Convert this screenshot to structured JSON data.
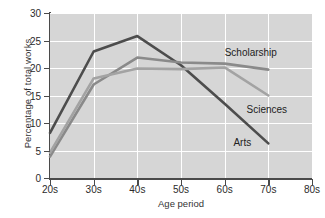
{
  "chart_data": {
    "type": "line",
    "title": "",
    "xlabel": "Age period",
    "ylabel": "Percentage of total works",
    "categories": [
      "20s",
      "30s",
      "40s",
      "50s",
      "60s",
      "70s",
      "80s"
    ],
    "x_tick_labels": [
      "20s",
      "30s",
      "40s",
      "50s",
      "60s",
      "70s",
      "80s"
    ],
    "y_tick_labels": [
      "0",
      "5",
      "10",
      "15",
      "20",
      "25",
      "30"
    ],
    "y_ticks": [
      0,
      5,
      10,
      15,
      20,
      25,
      30
    ],
    "xlim": [
      0,
      6
    ],
    "ylim": [
      0,
      30
    ],
    "grid": "white gridlines on gray panel",
    "legend_position": "inline annotations at line ends",
    "series": [
      {
        "name": "Arts",
        "color": "#4d4d4d",
        "x": [
          "20s",
          "30s",
          "40s",
          "50s",
          "60s",
          "70s"
        ],
        "values": [
          8.2,
          23.0,
          25.8,
          20.5,
          13.5,
          6.3
        ],
        "label": "Arts"
      },
      {
        "name": "Scholarship",
        "color": "#8a8a8a",
        "x": [
          "20s",
          "30s",
          "40s",
          "50s",
          "60s",
          "70s"
        ],
        "values": [
          3.9,
          17.0,
          21.9,
          21.0,
          20.8,
          19.7
        ],
        "label": "Scholarship"
      },
      {
        "name": "Sciences",
        "color": "#a3a3a3",
        "x": [
          "20s",
          "30s",
          "40s",
          "50s",
          "60s",
          "70s"
        ],
        "values": [
          4.6,
          18.1,
          19.9,
          19.8,
          20.1,
          15.0
        ],
        "label": "Sciences"
      }
    ],
    "annotations": [
      {
        "text": "Scholarship",
        "x": "60s",
        "y": 22.9
      },
      {
        "text": "Sciences",
        "x": "65s",
        "y": 12.6
      },
      {
        "text": "Arts",
        "x": "62s",
        "y": 6.6
      }
    ]
  },
  "colors": {
    "panel": "#d6d6d6",
    "gridline": "#ffffff",
    "axis": "#4a4a4a",
    "arts": "#4d4d4d",
    "scholarship": "#8a8a8a",
    "sciences": "#a3a3a3"
  }
}
